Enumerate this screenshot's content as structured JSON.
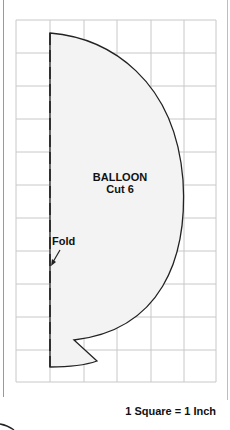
{
  "diagram": {
    "title": "BALLOON",
    "subtitle": "Cut 6",
    "fold_label": "Fold",
    "scale_label": "1 Square = 1 Inch",
    "grid": {
      "columns": 6,
      "rows": 11
    },
    "colors": {
      "grid": "#c8c8c8",
      "fill": "#f3f3f3",
      "outline": "#222222"
    }
  }
}
